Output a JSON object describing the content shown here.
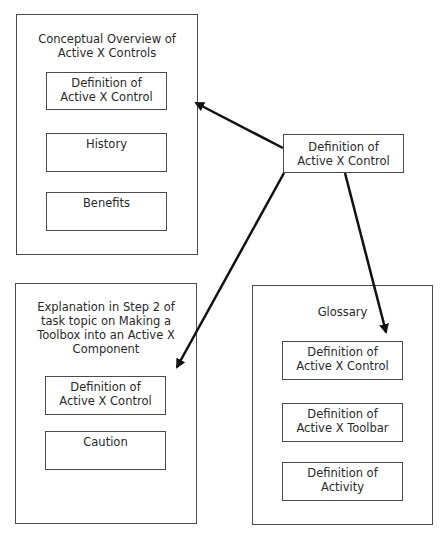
{
  "source": {
    "lines": [
      "Definition of",
      "Active X Control"
    ]
  },
  "panels": {
    "conceptual": {
      "title_lines": [
        "Conceptual Overview of",
        "Active X Controls"
      ],
      "items": [
        {
          "lines": [
            "Definition of",
            "Active X Control"
          ]
        },
        {
          "lines": [
            "History"
          ]
        },
        {
          "lines": [
            "Benefits"
          ]
        }
      ]
    },
    "explanation": {
      "title_lines": [
        "Explanation in Step 2 of",
        "task topic on Making a",
        "Toolbox into an Active X",
        "Component"
      ],
      "items": [
        {
          "lines": [
            "Definition of",
            "Active X Control"
          ]
        },
        {
          "lines": [
            "Caution"
          ]
        }
      ]
    },
    "glossary": {
      "title_lines": [
        "Glossary"
      ],
      "items": [
        {
          "lines": [
            "Definition of",
            "Active X Control"
          ]
        },
        {
          "lines": [
            "Definition of",
            "Active X Toolbar"
          ]
        },
        {
          "lines": [
            "Definition of",
            "Activity"
          ]
        }
      ]
    }
  },
  "colors": {
    "stroke": "#4a4a4a",
    "arrow": "#111111",
    "text": "#2a2a2a",
    "background": "#ffffff"
  }
}
